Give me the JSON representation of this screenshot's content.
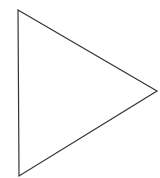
{
  "diagram": {
    "shape": "triangle",
    "vertices": [
      {
        "x": 18,
        "y": 10
      },
      {
        "x": 157,
        "y": 91
      },
      {
        "x": 19,
        "y": 176
      }
    ],
    "stroke": "#333333",
    "stroke_width": 1.2,
    "fill": "#ffffff",
    "background": "#ffffff"
  }
}
